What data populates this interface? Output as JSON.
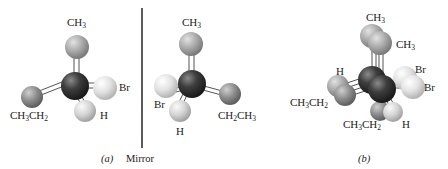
{
  "figure": {
    "panel_a": {
      "caption": "(a)",
      "left_molecule": {
        "top_label": "CH3",
        "right_label": "Br",
        "left_label": "CH3CH2",
        "bottom_label": "H"
      },
      "right_molecule": {
        "top_label": "CH3",
        "left_label": "Br",
        "bottom_label": "H",
        "right_label": "CH2CH3"
      },
      "mirror_label": "Mirror"
    },
    "panel_b": {
      "caption": "(b)",
      "labels": {
        "top_back": "CH3",
        "top_front": "CH3",
        "left_top": "H",
        "left_bottom": "CH3CH2",
        "right_back": "Br",
        "right_front": "Br",
        "bottom_left": "CH3CH2",
        "bottom_right": "H"
      }
    },
    "colors": {
      "carbon": "#3a3a3a",
      "methyl": "#a8a8a8",
      "ethyl": "#8a8a8a",
      "bromine": "#dcdcdc",
      "hydrogen": "#d0d0d0",
      "mirror_line": "#333333"
    }
  }
}
